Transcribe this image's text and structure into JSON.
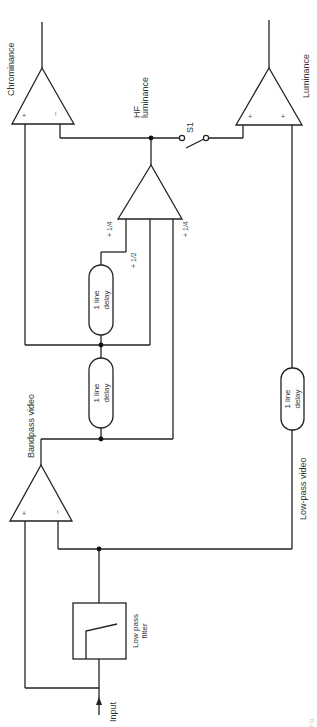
{
  "diagram": {
    "type": "block-diagram",
    "orientation": "rotated-90-ccw",
    "blocks": {
      "low_pass_filter": {
        "label_line1": "Low pass",
        "label_line2": "filter"
      },
      "delay_upper": {
        "label_line1": "1 line",
        "label_line2": "delay"
      },
      "delay_lower": {
        "label_line1": "1 line",
        "label_line2": "delay"
      },
      "delay_lowpass": {
        "label_line1": "1 line",
        "label_line2": "delay"
      }
    },
    "amplifiers": {
      "bandpass_amp": {
        "plus": "+",
        "minus": "−"
      },
      "summing_amp": {
        "weights": [
          "+1/4",
          "+1/2",
          "+1/4"
        ]
      },
      "chrominance_amp": {
        "plus": "+",
        "minus": "−"
      },
      "luminance_amp": {
        "plus_a": "+",
        "plus_b": "+"
      }
    },
    "labels": {
      "input": "Input",
      "bandpass_video": "Bandpass video",
      "lowpass_video": "Low-pass video",
      "hf_luminance_1": "HF",
      "hf_luminance_2": "luminance",
      "switch": "S1",
      "chrominance": "Chrominance",
      "luminance": "Luminance"
    },
    "weights": {
      "w1": "+",
      "w1_frac": "1/4",
      "w2": "+",
      "w2_frac": "1/2",
      "w3": "+",
      "w3_frac": "1/4"
    },
    "caption": "Fig."
  }
}
